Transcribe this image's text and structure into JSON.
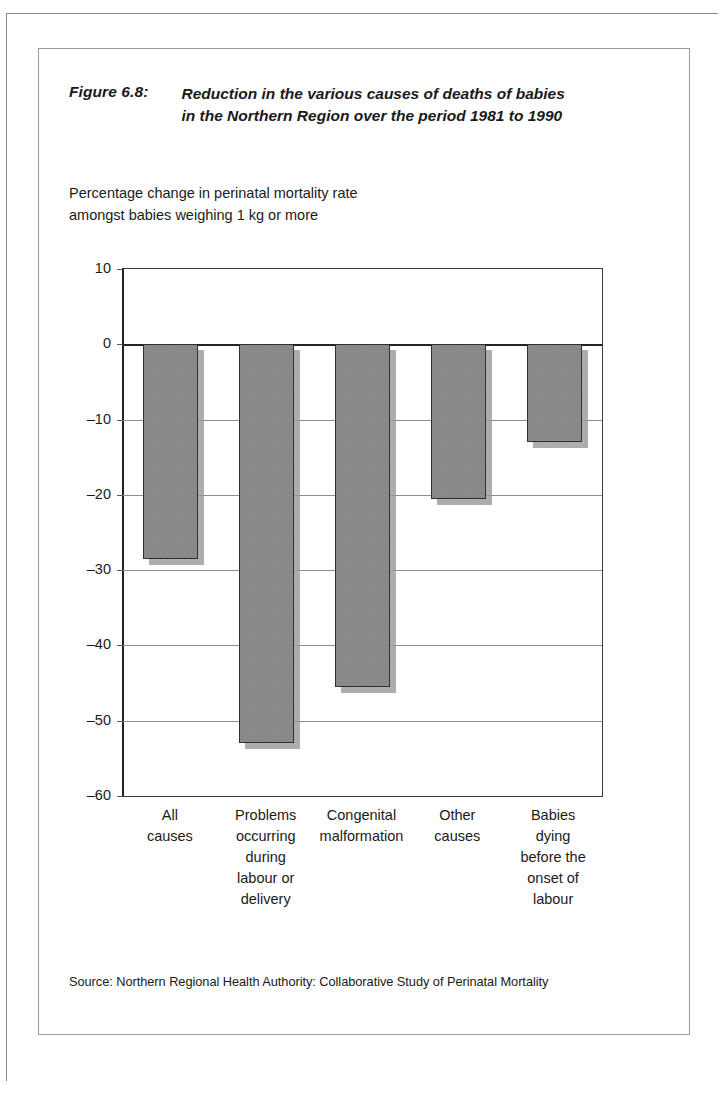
{
  "figure": {
    "label": "Figure 6.8:",
    "title_line1": "Reduction in the various causes of deaths of babies",
    "title_line2": "in the Northern Region over the period 1981 to 1990",
    "subtitle_line1": "Percentage change in perinatal mortality rate",
    "subtitle_line2": "amongst babies weighing 1 kg or more",
    "source": "Source: Northern Regional Health Authority: Collaborative Study of Perinatal Mortality"
  },
  "chart_data": {
    "type": "bar",
    "title": "Reduction in the various causes of deaths of babies in the Northern Region over the period 1981 to 1990",
    "subtitle": "Percentage change in perinatal mortality rate amongst babies weighing 1 kg or more",
    "categories": [
      "All causes",
      "Problems occurring during labour or delivery",
      "Congenital malformation",
      "Other causes",
      "Babies dying before the onset of labour"
    ],
    "category_lines": [
      [
        "All",
        "causes"
      ],
      [
        "Problems",
        "occurring",
        "during",
        "labour or",
        "delivery"
      ],
      [
        "Congenital",
        "malformation"
      ],
      [
        "Other",
        "causes"
      ],
      [
        "Babies",
        "dying",
        "before the",
        "onset of",
        "labour"
      ]
    ],
    "values": [
      -28.5,
      -53,
      -45.5,
      -20.5,
      -13
    ],
    "xlabel": "",
    "ylabel": "",
    "ylim": [
      -60,
      10
    ],
    "yticks": [
      10,
      0,
      -10,
      -20,
      -30,
      -40,
      -50,
      -60
    ],
    "ytick_labels": [
      "10",
      "0",
      "–10",
      "–20",
      "–30",
      "–40",
      "–50",
      "–60"
    ],
    "grid": true,
    "legend": "none",
    "bar_color": "#808080",
    "bar_edge_color": "#2f2f2f"
  }
}
